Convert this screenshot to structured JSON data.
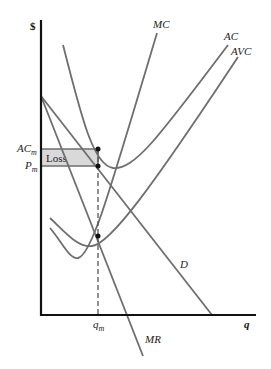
{
  "diagram": {
    "y_axis_label": "$",
    "x_axis_label": "q",
    "curves": {
      "mc": "MC",
      "ac": "AC",
      "avc": "AVC",
      "d": "D",
      "mr": "MR"
    },
    "price_labels": {
      "ac_main": "AC",
      "ac_sub": "m",
      "p_main": "P",
      "p_sub": "m"
    },
    "quantity_label": {
      "main": "q",
      "sub": "m"
    },
    "region_label": "Loss",
    "colors": {
      "curve": "#6e6e6e",
      "axis": "#111111",
      "loss_fill": "#d9d9d9"
    }
  }
}
